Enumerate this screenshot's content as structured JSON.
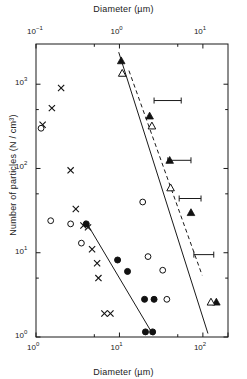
{
  "chart_data": {
    "type": "scatter",
    "title": "",
    "top_xlabel": "Diameter (µm)",
    "bottom_xlabel": "Diameter (µm)",
    "ylabel": "Number of particles (N / cm³)",
    "log_x": true,
    "log_y": true,
    "xlim_bottom": [
      1,
      200
    ],
    "xlim_top": [
      0.1,
      20
    ],
    "ylim": [
      1,
      3000
    ],
    "grid": false,
    "legend": null,
    "top_axis": {
      "label": "Diameter (µm)",
      "tick_labels": [
        "10⁻¹",
        "10⁰",
        "10¹"
      ],
      "tick_exponents": [
        -1,
        0,
        1
      ],
      "tick_mantissa": "10"
    },
    "bottom_axis": {
      "label": "Diameter (µm)",
      "tick_labels": [
        "10⁰",
        "10¹",
        "10²"
      ],
      "tick_exponents": [
        0,
        1,
        2
      ],
      "tick_mantissa": "10"
    },
    "y_axis": {
      "label": "Number of particles (N / cm³)",
      "tick_labels": [
        "10⁰",
        "10¹",
        "10²",
        "10³"
      ],
      "tick_exponents": [
        0,
        1,
        2,
        3
      ],
      "tick_mantissa": "10"
    },
    "series": [
      {
        "name": "cross-markers",
        "marker": "x",
        "axis": "bottom",
        "color": "#111111",
        "points": [
          {
            "x": 2.0,
            "y": 900
          },
          {
            "x": 1.55,
            "y": 520
          },
          {
            "x": 1.2,
            "y": 330
          },
          {
            "x": 2.6,
            "y": 95
          },
          {
            "x": 3.0,
            "y": 33
          },
          {
            "x": 3.7,
            "y": 21
          },
          {
            "x": 4.2,
            "y": 20
          },
          {
            "x": 4.7,
            "y": 11
          },
          {
            "x": 5.4,
            "y": 7.5
          },
          {
            "x": 5.6,
            "y": 5.0
          },
          {
            "x": 6.6,
            "y": 1.9
          },
          {
            "x": 7.8,
            "y": 1.9
          }
        ]
      },
      {
        "name": "open-circles",
        "marker": "open-circle",
        "axis": "bottom",
        "color": "#111111",
        "points": [
          {
            "x": 1.15,
            "y": 300
          },
          {
            "x": 1.5,
            "y": 24
          },
          {
            "x": 2.6,
            "y": 22
          },
          {
            "x": 3.5,
            "y": 13
          },
          {
            "x": 19.0,
            "y": 40
          },
          {
            "x": 22.0,
            "y": 9.0
          },
          {
            "x": 33.0,
            "y": 6.2
          },
          {
            "x": 37.0,
            "y": 2.8
          }
        ]
      },
      {
        "name": "filled-circles",
        "marker": "filled-circle",
        "axis": "bottom",
        "color": "#111111",
        "points": [
          {
            "x": 4.0,
            "y": 22
          },
          {
            "x": 9.5,
            "y": 8.2
          },
          {
            "x": 12.5,
            "y": 6.0
          },
          {
            "x": 20.0,
            "y": 2.8
          },
          {
            "x": 26.0,
            "y": 2.8
          },
          {
            "x": 20.5,
            "y": 1.15
          },
          {
            "x": 25.0,
            "y": 1.15
          }
        ]
      },
      {
        "name": "filled-triangles",
        "marker": "filled-triangle",
        "axis": "bottom",
        "color": "#111111",
        "points": [
          {
            "x": 10.5,
            "y": 1900
          },
          {
            "x": 23.0,
            "y": 420
          },
          {
            "x": 40.0,
            "y": 125
          },
          {
            "x": 72.0,
            "y": 30
          },
          {
            "x": 145.0,
            "y": 2.6
          }
        ]
      },
      {
        "name": "open-triangles",
        "marker": "open-triangle",
        "axis": "bottom",
        "color": "#111111",
        "points": [
          {
            "x": 10.8,
            "y": 1350
          },
          {
            "x": 24.5,
            "y": 320
          },
          {
            "x": 41.0,
            "y": 59
          },
          {
            "x": 125.0,
            "y": 2.6
          }
        ]
      }
    ],
    "error_bars": [
      {
        "y": 640,
        "x_low": 26.0,
        "x_high": 55.0
      },
      {
        "y": 125,
        "x_low": 38.0,
        "x_high": 72.0
      },
      {
        "y": 44.0,
        "x_low": 52.0,
        "x_high": 95.0
      },
      {
        "y": 9.5,
        "x_low": 78.0,
        "x_high": 135.0
      }
    ],
    "fit_lines": [
      {
        "name": "solid-line-right",
        "style": "solid",
        "x0": 9.8,
        "y0": 2400,
        "x1": 115.0,
        "y1": 1.1
      },
      {
        "name": "dashed-line-right",
        "style": "dashed",
        "x0": 13.0,
        "y0": 1450,
        "x1": 98.0,
        "y1": 5.4
      },
      {
        "name": "solid-line-left",
        "style": "solid",
        "x0": 3.9,
        "y0": 24,
        "x1": 25.5,
        "y1": 1.05
      }
    ]
  }
}
